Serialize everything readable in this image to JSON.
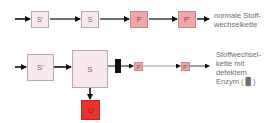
{
  "colors": {
    "substrate_fill": "#f9e9ef",
    "product_fill": "#f1a7a8",
    "byproduct_fill": "#e8322a",
    "arrow": "#111111",
    "defect_enzyme": "#111111"
  },
  "normal_chain": {
    "nodes": [
      {
        "id": "S_prime",
        "label": "S'"
      },
      {
        "id": "S",
        "label": "S"
      },
      {
        "id": "P",
        "label": "P"
      },
      {
        "id": "P_prime",
        "label": "P'"
      }
    ],
    "caption_line1": "normale Stoff-",
    "caption_line2": "wechselkette"
  },
  "defect_chain": {
    "nodes": [
      {
        "id": "S_prime",
        "label": "S'"
      },
      {
        "id": "S",
        "label": "S"
      },
      {
        "id": "P",
        "label": "P"
      },
      {
        "id": "P_prime",
        "label": "P'"
      },
      {
        "id": "U",
        "label": "U"
      }
    ],
    "caption_line1": "Stoffwechsel-",
    "caption_line2": "kette mit",
    "caption_line3": "defektem",
    "caption_line4": "Enzym ( █ )"
  }
}
